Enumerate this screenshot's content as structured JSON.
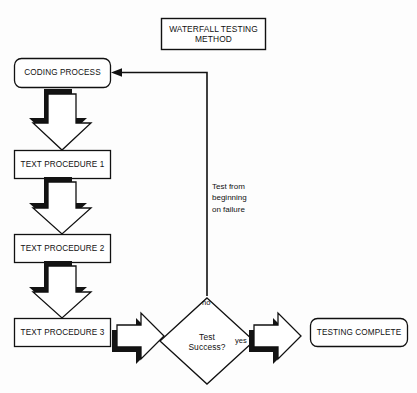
{
  "diagram": {
    "title_box": {
      "label": "WATERFALL TESTING\nMETHOD"
    },
    "nodes": [
      {
        "id": "coding",
        "label": "CODING PROCESS",
        "shape": "rounded-rect"
      },
      {
        "id": "proc1",
        "label": "TEXT PROCEDURE 1",
        "shape": "rect"
      },
      {
        "id": "proc2",
        "label": "TEXT PROCEDURE 2",
        "shape": "rect"
      },
      {
        "id": "proc3",
        "label": "TEXT PROCEDURE 3",
        "shape": "rect"
      },
      {
        "id": "decision",
        "label": "Test\nSuccess?",
        "shape": "diamond"
      },
      {
        "id": "complete",
        "label": "TESTING COMPLETE",
        "shape": "rounded-rect"
      }
    ],
    "edge_labels": {
      "no": "no",
      "yes": "yes"
    },
    "annotations": {
      "feedback": "Test from\nbeginning\non failure"
    },
    "colors": {
      "stroke": "#111111",
      "shadow": "#101010",
      "fill": "#ffffff",
      "background": "#fdfdfd"
    }
  }
}
